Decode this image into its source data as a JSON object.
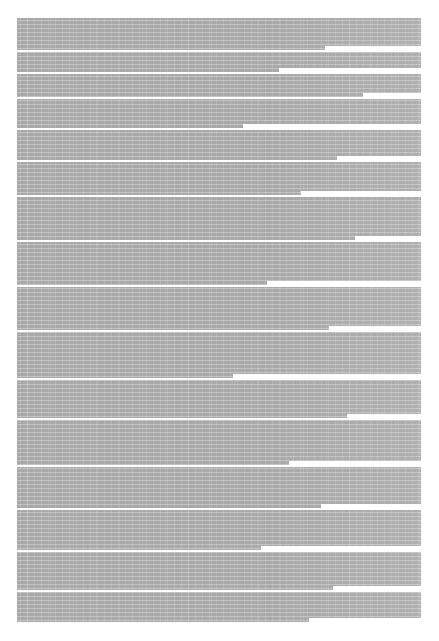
{
  "page": {
    "width": 439,
    "height": 641,
    "background_color": "#ffffff",
    "kind": "document-page-thumbnail",
    "columns": 1,
    "has_header": false,
    "has_footer": false,
    "has_page_number": false,
    "has_title": false,
    "has_images": false,
    "has_tables": false
  },
  "text_block": {
    "left": 17,
    "top": 18,
    "width": 404,
    "height": 604,
    "right": 421,
    "bottom": 622,
    "alignment": "justified",
    "ink_color": "#a9a9a9",
    "line_pitch_px": 4,
    "approx_line_count": 151,
    "legible": false,
    "note": "Body text is rendered below glyph resolution; no characters are readable at any magnification."
  },
  "margins": {
    "left": 17,
    "right": 18,
    "top": 18,
    "bottom": 19,
    "color": "#ffffff"
  },
  "paragraph_gaps": [
    {
      "top": 32,
      "height": 2
    },
    {
      "top": 54,
      "height": 2
    },
    {
      "top": 79,
      "height": 2
    },
    {
      "top": 110,
      "height": 2
    },
    {
      "top": 142,
      "height": 2
    },
    {
      "top": 177,
      "height": 2
    },
    {
      "top": 222,
      "height": 2
    },
    {
      "top": 267,
      "height": 2
    },
    {
      "top": 312,
      "height": 2
    },
    {
      "top": 360,
      "height": 2
    },
    {
      "top": 400,
      "height": 2
    },
    {
      "top": 447,
      "height": 2
    },
    {
      "top": 490,
      "height": 2
    },
    {
      "top": 532,
      "height": 2
    },
    {
      "top": 572,
      "height": 2
    }
  ],
  "short_line_tails": [
    {
      "top": 28,
      "right": 0,
      "width": 96,
      "height": 4
    },
    {
      "top": 50,
      "right": 0,
      "width": 142,
      "height": 4
    },
    {
      "top": 75,
      "right": 0,
      "width": 58,
      "height": 4
    },
    {
      "top": 106,
      "right": 0,
      "width": 178,
      "height": 4
    },
    {
      "top": 138,
      "right": 0,
      "width": 84,
      "height": 4
    },
    {
      "top": 173,
      "right": 0,
      "width": 120,
      "height": 4
    },
    {
      "top": 218,
      "right": 0,
      "width": 66,
      "height": 4
    },
    {
      "top": 263,
      "right": 0,
      "width": 154,
      "height": 4
    },
    {
      "top": 308,
      "right": 0,
      "width": 92,
      "height": 4
    },
    {
      "top": 356,
      "right": 0,
      "width": 188,
      "height": 4
    },
    {
      "top": 396,
      "right": 0,
      "width": 74,
      "height": 4
    },
    {
      "top": 443,
      "right": 0,
      "width": 132,
      "height": 4
    },
    {
      "top": 486,
      "right": 0,
      "width": 100,
      "height": 4
    },
    {
      "top": 528,
      "right": 0,
      "width": 160,
      "height": 4
    },
    {
      "top": 568,
      "right": 0,
      "width": 88,
      "height": 4
    },
    {
      "top": 600,
      "right": 0,
      "width": 112,
      "height": 4
    }
  ]
}
